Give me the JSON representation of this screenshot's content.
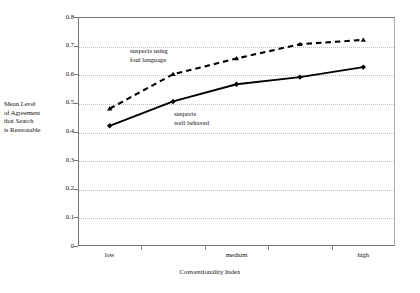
{
  "figure": {
    "background": "#ffffff",
    "frame_color": "#777777",
    "gridline_color": "#bdbdbd"
  },
  "chart_data": {
    "type": "line",
    "title": "",
    "xlabel": "Conventionality Index",
    "ylabel": "Mean Level of Agreement that Search is Reasonable",
    "ylabel_lines": [
      "Mean Level",
      "of Agreement",
      "that Search",
      "is Reasonable"
    ],
    "x": [
      1,
      2,
      3,
      4,
      5
    ],
    "categories": [
      "low",
      "",
      "medium",
      "",
      "high"
    ],
    "xtick_labels": [
      "low",
      "medium",
      "high"
    ],
    "ytick_labels": [
      "0",
      "0.1",
      "0.2",
      "0.3",
      "0.4",
      "0.5",
      "0.6",
      "0.7",
      "0.8"
    ],
    "ytick_values": [
      0,
      0.1,
      0.2,
      0.3,
      0.4,
      0.5,
      0.6,
      0.7,
      0.8
    ],
    "ylim": [
      0,
      0.8
    ],
    "grid": "horizontal-dotted",
    "legend": "inline-annotations",
    "series": [
      {
        "name": "suspects using foul language",
        "label_lines": [
          "suspects using",
          "foul language"
        ],
        "style": "dashed",
        "marker": "triangle",
        "color": "#000000",
        "values": [
          0.48,
          0.6,
          0.655,
          0.705,
          0.72
        ]
      },
      {
        "name": "suspects well behaved",
        "label_lines": [
          "suspects",
          "well behaved"
        ],
        "style": "solid",
        "marker": "diamond",
        "color": "#000000",
        "values": [
          0.42,
          0.505,
          0.565,
          0.59,
          0.625
        ]
      }
    ],
    "annotations": [
      {
        "id": "foul-language-label",
        "text": "suspects using foul language"
      },
      {
        "id": "well-behaved-label",
        "text": "suspects well behaved"
      }
    ]
  },
  "axes": {
    "y_title_l1": "Mean Level",
    "y_title_l2": "of Agreement",
    "y_title_l3": "that Search",
    "y_title_l4": "is Reasonable",
    "x_title": "Conventionality Index"
  },
  "annotations": {
    "foul_l1": "suspects using",
    "foul_l2": "foul language",
    "behaved_l1": "suspects",
    "behaved_l2": "well behaved"
  }
}
